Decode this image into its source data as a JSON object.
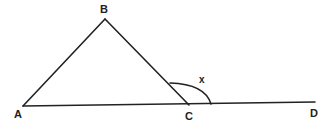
{
  "diagram": {
    "points": {
      "A": "A",
      "B": "B",
      "C": "C",
      "D": "D"
    },
    "segments": [
      "AB",
      "BC",
      "AD"
    ],
    "angle_label": "x",
    "angle_at": "C",
    "angle_between": [
      "CB",
      "CD"
    ]
  }
}
